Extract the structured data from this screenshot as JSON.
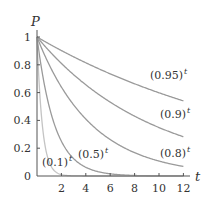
{
  "chart_data": {
    "type": "line",
    "title": "",
    "xlabel": "t",
    "ylabel": "P",
    "xlim": [
      0,
      12
    ],
    "ylim": [
      0,
      1
    ],
    "grid": false,
    "legend": "inline labels near curves",
    "x_ticks": [
      2,
      4,
      6,
      8,
      10,
      12
    ],
    "y_ticks": [
      0,
      0.2,
      0.4,
      0.6,
      0.8,
      1
    ],
    "x_tick_labels": [
      "2",
      "4",
      "6",
      "8",
      "10",
      "12"
    ],
    "y_tick_labels": [
      "0",
      "0.2",
      "0.4",
      "0.6",
      "0.8",
      "1"
    ],
    "x": [
      0,
      1,
      2,
      3,
      4,
      5,
      6,
      7,
      8,
      9,
      10,
      11,
      12
    ],
    "series": [
      {
        "name": "(0.95)^t",
        "base": 0.95,
        "label": "(0.95)",
        "label_sup": "t",
        "color": "#9a9a9a",
        "values": [
          1,
          0.95,
          0.9025,
          0.857,
          0.815,
          0.774,
          0.735,
          0.698,
          0.663,
          0.63,
          0.599,
          0.569,
          0.54
        ]
      },
      {
        "name": "(0.9)^t",
        "base": 0.9,
        "label": "(0.9)",
        "label_sup": "t",
        "color": "#9a9a9a",
        "values": [
          1,
          0.9,
          0.81,
          0.729,
          0.656,
          0.59,
          0.531,
          0.478,
          0.43,
          0.387,
          0.349,
          0.314,
          0.282
        ]
      },
      {
        "name": "(0.8)^t",
        "base": 0.8,
        "label": "(0.8)",
        "label_sup": "t",
        "color": "#9a9a9a",
        "values": [
          1,
          0.8,
          0.64,
          0.512,
          0.41,
          0.328,
          0.262,
          0.21,
          0.168,
          0.134,
          0.107,
          0.086,
          0.069
        ]
      },
      {
        "name": "(0.5)^t",
        "base": 0.5,
        "label": "(0.5)",
        "label_sup": "t",
        "color": "#9a9a9a",
        "values": [
          1,
          0.5,
          0.25,
          0.125,
          0.0625,
          0.031,
          0.016,
          0.008,
          0.004,
          0.002,
          0.001,
          0.0005,
          0.0002
        ]
      },
      {
        "name": "(0.1)^t",
        "base": 0.1,
        "label": "(0.1)",
        "label_sup": "t",
        "color": "#c4c4c4",
        "values": [
          1,
          0.1,
          0.01,
          0.001,
          0.0001,
          0,
          0,
          0,
          0,
          0,
          0,
          0,
          0
        ]
      }
    ]
  },
  "axes": {
    "x_label": "t",
    "y_label": "P"
  },
  "layout": {
    "origin_px": [
      37,
      176
    ],
    "x_px_per_unit": 12.2,
    "y_px_per_unit": 139,
    "x_axis_end_px": 190,
    "y_axis_top_px": 30,
    "label_positions": {
      "(0.95)^t": [
        150,
        79
      ],
      "(0.9)^t": [
        160,
        118
      ],
      "(0.8)^t": [
        160,
        157
      ],
      "(0.5)^t": [
        78,
        158
      ],
      "(0.1)^t": [
        42,
        166
      ]
    }
  }
}
